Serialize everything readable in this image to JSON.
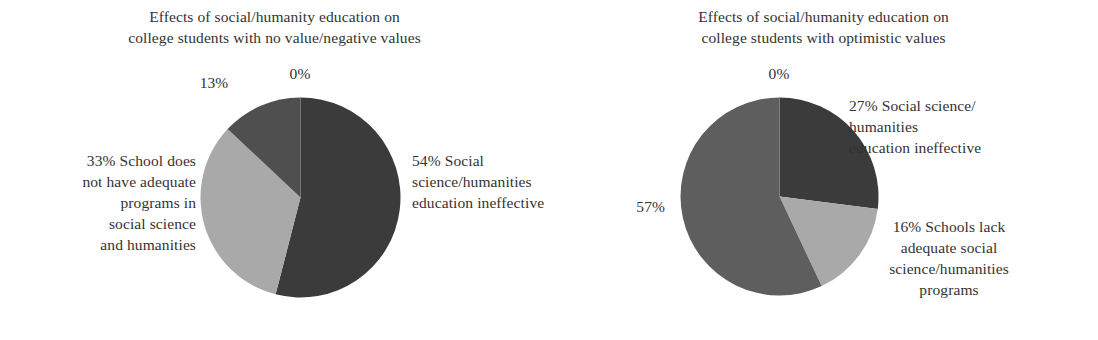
{
  "figures": [
    {
      "id": "left",
      "title": "Effects of social/humanity education on\ncollege students with no value/negative values",
      "labels": {
        "pct_zero": "0%",
        "pct_thirteen": "13%",
        "label_thirtythree": "33% School does\nnot have adequate\nprograms in\nsocial science\nand humanities",
        "label_fiftyfour": "54% Social\nscience/humanities\neducation ineffective"
      }
    },
    {
      "id": "right",
      "title": "Effects of social/humanity education on\ncollege students with optimistic values",
      "labels": {
        "pct_zero": "0%",
        "pct_fiftyseven": "57%",
        "label_twentyseven": "27% Social science/\nhumanities\neducation ineffective",
        "label_sixteen": "16% Schools lack\nadequate social\nscience/humanities\nprograms"
      }
    }
  ],
  "colors": {
    "slice_dark": "#3b3b3b",
    "slice_medium_dark": "#4f4f4f",
    "slice_medium": "#5e5e5e",
    "slice_light": "#a9a9a9",
    "text": "#333333",
    "background": "#ffffff"
  },
  "chart_data": [
    {
      "type": "pie",
      "title": "Effects of social/humanity education on college students with no value/negative values",
      "xlabel": "",
      "ylabel": "",
      "legend_position": "labels-around-slices",
      "grid": false,
      "start_angle_deg": 0,
      "direction": "clockwise",
      "categories": [
        "Social science/humanities education ineffective",
        "School does not have adequate programs in social science and humanities",
        "13%",
        "0%"
      ],
      "values": [
        54,
        33,
        13,
        0
      ],
      "data_labels": [
        "54%",
        "33%",
        "13%",
        "0%"
      ],
      "slice_colors": [
        "#3b3b3b",
        "#a9a9a9",
        "#4f4f4f",
        "#000000"
      ]
    },
    {
      "type": "pie",
      "title": "Effects of social/humanity education on college students with optimistic values",
      "xlabel": "",
      "ylabel": "",
      "legend_position": "labels-around-slices",
      "grid": false,
      "start_angle_deg": 0,
      "direction": "clockwise",
      "categories": [
        "Social science/humanities education ineffective",
        "Schools lack adequate social science/humanities programs",
        "57%",
        "0%"
      ],
      "values": [
        27,
        16,
        57,
        0
      ],
      "data_labels": [
        "27%",
        "16%",
        "57%",
        "0%"
      ],
      "slice_colors": [
        "#3b3b3b",
        "#a9a9a9",
        "#5e5e5e",
        "#000000"
      ]
    }
  ]
}
